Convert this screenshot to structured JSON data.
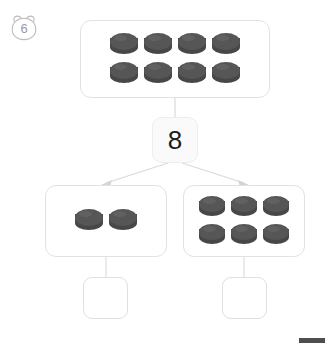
{
  "page": {
    "background_color": "#ffffff",
    "width": 327,
    "height": 344
  },
  "question_badge": {
    "icon": "bear-head-icon",
    "number": "6",
    "color": "#9a9a9a"
  },
  "whole": {
    "label": "whole-group",
    "counter_count": 8,
    "rows": [
      4,
      4
    ],
    "counter_color": "#4f4f4f"
  },
  "number_bond": {
    "whole_value": "8",
    "whole_value_color": "#1c1c1c"
  },
  "parts": [
    {
      "label": "part-left",
      "counter_count": 2,
      "rows": [
        2
      ],
      "answer_value": "",
      "answer_placeholder": ""
    },
    {
      "label": "part-right",
      "counter_count": 6,
      "rows": [
        3,
        3
      ],
      "answer_value": "",
      "answer_placeholder": ""
    }
  ],
  "connectors": {
    "stroke_color": "#d8d8d8",
    "arrow_color": "#cfcfcf"
  }
}
